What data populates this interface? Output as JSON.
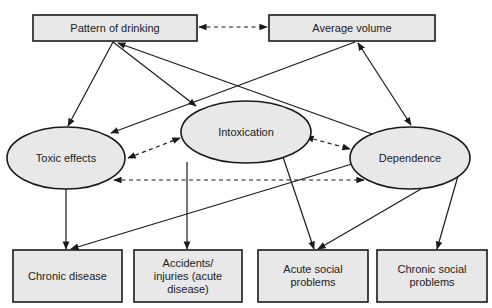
{
  "diagram": {
    "nodes": {
      "pattern": {
        "label": "Pattern of drinking",
        "shape": "box"
      },
      "average": {
        "label": "Average volume",
        "shape": "box"
      },
      "toxic": {
        "label": "Toxic effects",
        "shape": "ellipse"
      },
      "intoxication": {
        "label": "Intoxication",
        "shape": "ellipse"
      },
      "dependence": {
        "label": "Dependence",
        "shape": "ellipse"
      },
      "chronic_disease": {
        "label": "Chronic disease",
        "shape": "box"
      },
      "accidents": {
        "label": "Accidents/\ninjuries (acute\ndisease)",
        "shape": "box"
      },
      "acute_social": {
        "label": "Acute social\nproblems",
        "shape": "box"
      },
      "chronic_social": {
        "label": "Chronic social\nproblems",
        "shape": "box"
      }
    },
    "edges": [
      {
        "from": "pattern",
        "to": "average",
        "style": "dashed",
        "direction": "both"
      },
      {
        "from": "pattern",
        "to": "toxic",
        "style": "solid",
        "direction": "forward"
      },
      {
        "from": "pattern",
        "to": "intoxication",
        "style": "solid",
        "direction": "forward"
      },
      {
        "from": "dependence",
        "to": "pattern",
        "style": "solid",
        "direction": "forward"
      },
      {
        "from": "average",
        "to": "toxic",
        "style": "solid",
        "direction": "forward"
      },
      {
        "from": "average",
        "to": "dependence",
        "style": "solid",
        "direction": "both"
      },
      {
        "from": "toxic",
        "to": "intoxication",
        "style": "dashed",
        "direction": "both"
      },
      {
        "from": "intoxication",
        "to": "dependence",
        "style": "dashed",
        "direction": "both"
      },
      {
        "from": "toxic",
        "to": "dependence",
        "style": "dashed",
        "direction": "both"
      },
      {
        "from": "toxic",
        "to": "chronic_disease",
        "style": "solid",
        "direction": "forward"
      },
      {
        "from": "intoxication",
        "to": "accidents",
        "style": "solid",
        "direction": "forward"
      },
      {
        "from": "intoxication",
        "to": "acute_social",
        "style": "solid",
        "direction": "forward"
      },
      {
        "from": "dependence",
        "to": "chronic_disease",
        "style": "solid",
        "direction": "forward"
      },
      {
        "from": "dependence",
        "to": "acute_social",
        "style": "solid",
        "direction": "forward"
      },
      {
        "from": "dependence",
        "to": "chronic_social",
        "style": "solid",
        "direction": "forward"
      }
    ],
    "colors": {
      "fill": "#e8e8e8",
      "stroke": "#1a1a1a",
      "text": "#222222"
    }
  }
}
